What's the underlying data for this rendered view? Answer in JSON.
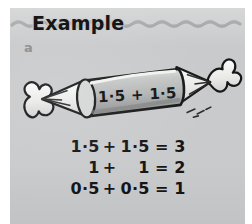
{
  "panel": {
    "background_color": "#c9cacb",
    "header": {
      "title": "Example",
      "rule_style": "wavy-line",
      "rule_color": "#9b9c9d"
    },
    "part_label": "a"
  },
  "illustration": {
    "name": "wrapped-sweet",
    "description": "A wrapped candy (sweet) drawn as a tilted cylinder with twisted frilly wrapper ends at left and right",
    "sweet_label": "1·5 + 1·5",
    "body_color": "#b0b1b2",
    "body_highlight_color": "#e4e4e3",
    "body_shadow_color": "#8b8c8d",
    "outline_color": "#1a1a1a",
    "wrapper_color": "#f1f1f0"
  },
  "equations": [
    {
      "lhs": "1·5",
      "op": "+",
      "rhs": "1·5",
      "eq": "=",
      "result": "3"
    },
    {
      "lhs": "1",
      "op": "+",
      "rhs": "1",
      "eq": "=",
      "result": "2"
    },
    {
      "lhs": "0·5",
      "op": "+",
      "rhs": "0·5",
      "eq": "=",
      "result": "1"
    }
  ]
}
